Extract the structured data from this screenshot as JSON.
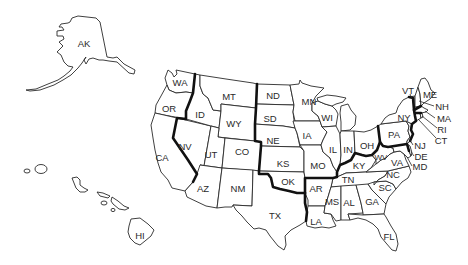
{
  "map": {
    "title": "United States",
    "line_color": "#2a2a2a",
    "region_line_color": "#111111",
    "background": "#ffffff",
    "states": [
      {
        "abbr": "AK",
        "x": 84,
        "y": 44
      },
      {
        "abbr": "HI",
        "x": 140,
        "y": 236
      },
      {
        "abbr": "WA",
        "x": 180,
        "y": 83
      },
      {
        "abbr": "OR",
        "x": 169,
        "y": 109
      },
      {
        "abbr": "CA",
        "x": 162,
        "y": 158
      },
      {
        "abbr": "NV",
        "x": 185,
        "y": 147
      },
      {
        "abbr": "ID",
        "x": 200,
        "y": 115
      },
      {
        "abbr": "MT",
        "x": 229,
        "y": 97
      },
      {
        "abbr": "WY",
        "x": 234,
        "y": 124
      },
      {
        "abbr": "UT",
        "x": 211,
        "y": 155
      },
      {
        "abbr": "CO",
        "x": 242,
        "y": 152
      },
      {
        "abbr": "AZ",
        "x": 203,
        "y": 189
      },
      {
        "abbr": "NM",
        "x": 238,
        "y": 189
      },
      {
        "abbr": "ND",
        "x": 273,
        "y": 96
      },
      {
        "abbr": "SD",
        "x": 270,
        "y": 119
      },
      {
        "abbr": "NE",
        "x": 273,
        "y": 141
      },
      {
        "abbr": "KS",
        "x": 283,
        "y": 164
      },
      {
        "abbr": "OK",
        "x": 288,
        "y": 182
      },
      {
        "abbr": "TX",
        "x": 275,
        "y": 216
      },
      {
        "abbr": "MN",
        "x": 309,
        "y": 102
      },
      {
        "abbr": "IA",
        "x": 307,
        "y": 136
      },
      {
        "abbr": "MO",
        "x": 318,
        "y": 166
      },
      {
        "abbr": "AR",
        "x": 316,
        "y": 189
      },
      {
        "abbr": "LA",
        "x": 316,
        "y": 222
      },
      {
        "abbr": "WI",
        "x": 327,
        "y": 118
      },
      {
        "abbr": "IL",
        "x": 333,
        "y": 150
      },
      {
        "abbr": "MS",
        "x": 330,
        "y": 202
      },
      {
        "abbr": "IN",
        "x": 348,
        "y": 150
      },
      {
        "abbr": "OH",
        "x": 368,
        "y": 146
      },
      {
        "abbr": "KY",
        "x": 359,
        "y": 166
      },
      {
        "abbr": "TN",
        "x": 348,
        "y": 180
      },
      {
        "abbr": "AL",
        "x": 348,
        "y": 203
      },
      {
        "abbr": "GA",
        "x": 372,
        "y": 202
      },
      {
        "abbr": "FL",
        "x": 389,
        "y": 237
      },
      {
        "abbr": "SC",
        "x": 385,
        "y": 187
      },
      {
        "abbr": "NC",
        "x": 393,
        "y": 175
      },
      {
        "abbr": "VA",
        "x": 397,
        "y": 163
      },
      {
        "abbr": "WV",
        "x": 380,
        "y": 158
      },
      {
        "abbr": "PA",
        "x": 394,
        "y": 135
      },
      {
        "abbr": "NY",
        "x": 404,
        "y": 118
      },
      {
        "abbr": "VT",
        "x": 408,
        "y": 93
      },
      {
        "abbr": "ME",
        "x": 430,
        "y": 95
      },
      {
        "abbr": "NH",
        "x": 442,
        "y": 107
      },
      {
        "abbr": "MA",
        "x": 444,
        "y": 119
      },
      {
        "abbr": "RI",
        "x": 442,
        "y": 130
      },
      {
        "abbr": "CT",
        "x": 441,
        "y": 141
      },
      {
        "abbr": "NJ",
        "x": 418,
        "y": 146
      },
      {
        "abbr": "DE",
        "x": 419,
        "y": 157
      },
      {
        "abbr": "MD",
        "x": 418,
        "y": 167
      }
    ]
  }
}
